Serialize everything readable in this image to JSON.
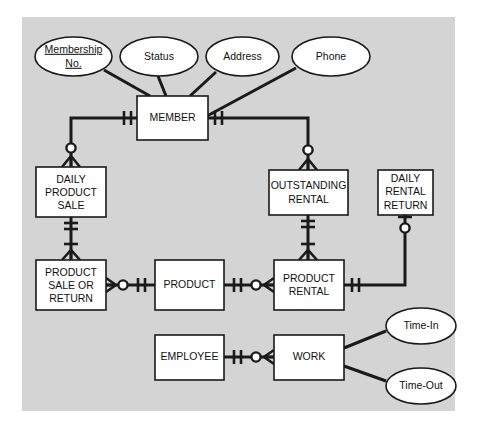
{
  "diagram": {
    "notation": "crow's foot",
    "canvas_color": "#d4d4d4",
    "entity_fill": "#ffffff",
    "line_color": "#1a1a1a"
  },
  "entities": [
    {
      "id": "member",
      "lines": [
        "MEMBER"
      ]
    },
    {
      "id": "daily_product_sale",
      "lines": [
        "DAILY",
        "PRODUCT",
        "SALE"
      ]
    },
    {
      "id": "outstanding_rental",
      "lines": [
        "OUTSTANDING",
        "RENTAL"
      ]
    },
    {
      "id": "daily_rental_return",
      "lines": [
        "DAILY",
        "RENTAL",
        "RETURN"
      ]
    },
    {
      "id": "product_sale_or_return",
      "lines": [
        "PRODUCT",
        "SALE OR",
        "RETURN"
      ]
    },
    {
      "id": "product",
      "lines": [
        "PRODUCT"
      ]
    },
    {
      "id": "product_rental",
      "lines": [
        "PRODUCT",
        "RENTAL"
      ]
    },
    {
      "id": "employee",
      "lines": [
        "EMPLOYEE"
      ]
    },
    {
      "id": "work",
      "lines": [
        "WORK"
      ]
    }
  ],
  "attributes": [
    {
      "id": "membership_no",
      "lines": [
        "Membership",
        "No."
      ],
      "key": true
    },
    {
      "id": "status",
      "lines": [
        "Status"
      ],
      "key": false
    },
    {
      "id": "address",
      "lines": [
        "Address"
      ],
      "key": false
    },
    {
      "id": "phone",
      "lines": [
        "Phone"
      ],
      "key": false
    },
    {
      "id": "time_in",
      "lines": [
        "Time-In"
      ],
      "key": false
    },
    {
      "id": "time_out",
      "lines": [
        "Time-Out"
      ],
      "key": false
    }
  ],
  "relationships": [
    {
      "from": "member",
      "to": "daily_product_sale",
      "from_card": "one-and-only-one",
      "to_card": "zero-or-many"
    },
    {
      "from": "member",
      "to": "outstanding_rental",
      "from_card": "one-and-only-one",
      "to_card": "zero-or-many"
    },
    {
      "from": "daily_product_sale",
      "to": "product_sale_or_return",
      "from_card": "one-and-only-one",
      "to_card": "one-or-many"
    },
    {
      "from": "outstanding_rental",
      "to": "product_rental",
      "from_card": "one-and-only-one",
      "to_card": "one-or-many"
    },
    {
      "from": "product_sale_or_return",
      "to": "product",
      "from_card": "zero-or-many",
      "to_card": "one-and-only-one"
    },
    {
      "from": "product",
      "to": "product_rental",
      "from_card": "one-and-only-one",
      "to_card": "zero-or-many"
    },
    {
      "from": "product_rental",
      "to": "daily_rental_return",
      "from_card": "one-and-only-one",
      "to_card": "zero-or-one"
    },
    {
      "from": "employee",
      "to": "work",
      "from_card": "one-and-only-one",
      "to_card": "zero-or-many"
    }
  ]
}
